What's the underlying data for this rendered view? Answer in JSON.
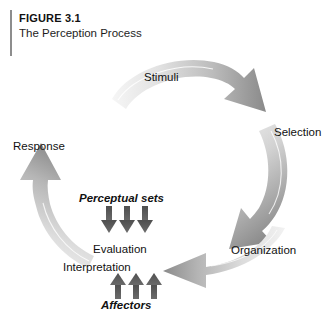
{
  "caption": {
    "figure_number": "FIGURE 3.1",
    "title": "The Perception Process",
    "rule_color": "#8d8d8d"
  },
  "diagram": {
    "type": "cycle-diagram",
    "stages": [
      {
        "id": "stimuli",
        "label": "Stimuli"
      },
      {
        "id": "selection",
        "label": "Selection"
      },
      {
        "id": "organization",
        "label": "Organization"
      },
      {
        "id": "interpretation",
        "label": "Interpretation"
      },
      {
        "id": "evaluation",
        "label": "Evaluation"
      },
      {
        "id": "response",
        "label": "Response"
      }
    ],
    "influences": [
      {
        "id": "perceptual-sets",
        "label": "Perceptual sets",
        "direction": "down",
        "arrow_count": 3,
        "targets": "evaluation"
      },
      {
        "id": "affectors",
        "label": "Affectors",
        "direction": "up",
        "arrow_count": 3,
        "targets": "interpretation"
      }
    ],
    "cycle_arrows": [
      {
        "id": "arrow-stimuli-to-selection",
        "from": "stimuli",
        "to": "selection"
      },
      {
        "id": "arrow-selection-to-organization",
        "from": "selection",
        "to": "organization"
      },
      {
        "id": "arrow-organization-to-interpretation",
        "from": "organization",
        "to": "interpretation"
      },
      {
        "id": "arrow-response-to-stimuli",
        "from": "response",
        "to": "stimuli"
      }
    ],
    "colors": {
      "arrow_light": "#f2f2f2",
      "arrow_mid": "#c9c9c9",
      "arrow_dark": "#8f8f8f",
      "arrow_darkest": "#6e6e6e",
      "influence_arrow": "#575757",
      "text": "#111111",
      "background": "#ffffff"
    }
  }
}
